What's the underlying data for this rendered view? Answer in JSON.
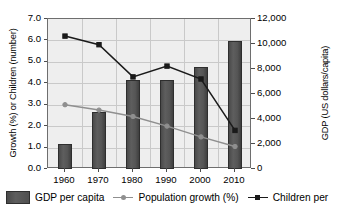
{
  "chart_data": {
    "type": "bar",
    "title": "",
    "subtitle": "",
    "categories": [
      "1960",
      "1970",
      "1980",
      "1990",
      "2000",
      "2010"
    ],
    "xlabel": "",
    "grid": true,
    "legend_position": "bottom",
    "axes": {
      "left": {
        "label": "Growth (%) or Children (number)",
        "ticks": [
          "0.0",
          "1.0",
          "2.0",
          "3.0",
          "4.0",
          "5.0",
          "6.0",
          "7.0"
        ],
        "min": 0.0,
        "max": 7.0,
        "step": 1.0
      },
      "right": {
        "label": "GDP (US dollars/capita)",
        "ticks": [
          "0",
          "2,000",
          "4,000",
          "6,000",
          "8,000",
          "10,000",
          "12,000"
        ],
        "min": 0,
        "max": 12000,
        "step": 2000
      }
    },
    "series": [
      {
        "name": "GDP per capita",
        "type": "bar",
        "axis": "right",
        "color": "#4f4f4f",
        "values": [
          2000,
          4550,
          7150,
          7150,
          8150,
          10250
        ]
      },
      {
        "name": "Population growth (%)",
        "type": "line",
        "axis": "left",
        "color": "#8f8f8f",
        "marker": "circle",
        "values": [
          3.0,
          2.75,
          2.45,
          2.0,
          1.5,
          1.05
        ]
      },
      {
        "name": "Children per",
        "type": "line",
        "axis": "left",
        "color": "#1a1a1a",
        "marker": "square",
        "values": [
          6.2,
          5.8,
          4.3,
          4.8,
          4.2,
          1.8
        ]
      }
    ]
  },
  "legend": {
    "items": [
      {
        "label": "GDP per capita",
        "marker": "bar-swatch"
      },
      {
        "label": "Population growth (%)",
        "marker": "line-circle"
      },
      {
        "label": "Children per",
        "marker": "line-square"
      }
    ]
  },
  "colors": {
    "bar": "#4f4f4f",
    "population_line": "#8f8f8f",
    "children_line": "#1a1a1a",
    "plot_background": "#eeeeee",
    "grid": "#c9c9c9",
    "frame": "#6e6e6e"
  }
}
